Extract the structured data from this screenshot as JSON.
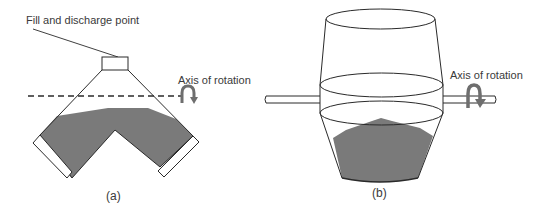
{
  "figure": {
    "panels": [
      {
        "id": "a",
        "caption": "(a)",
        "description": "V-shaped (twin-shell) blender with conical top",
        "labels": {
          "fill_point": "Fill and discharge point",
          "axis": "Axis of rotation"
        }
      },
      {
        "id": "b",
        "caption": "(b)",
        "description": "Double-cone blender mounted on a horizontal shaft",
        "labels": {
          "axis": "Axis of rotation"
        }
      }
    ],
    "colors": {
      "outline": "#2a2a2a",
      "powder_fill": "#7a7a7a",
      "rotation_arrow": "#6e6e6e",
      "background": "#ffffff",
      "text": "#3a3a3a"
    }
  }
}
